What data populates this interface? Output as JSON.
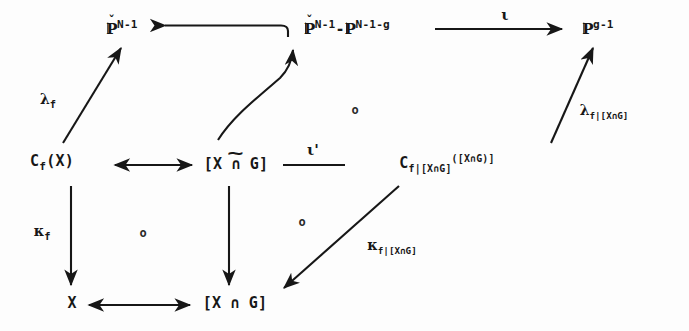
{
  "figure": {
    "kind": "commutative-diagram",
    "width": 689,
    "height": 331,
    "background_color": "#fdfdfd",
    "ink_color": "#171717"
  },
  "nodes": {
    "top_left": {
      "id": "node-p-dual-n-1",
      "plain": "P^(N-1) dual",
      "base": "P",
      "accent": "caron",
      "superscript": "N-1",
      "x": 122,
      "y": 28
    },
    "top_middle": {
      "id": "node-p-dual-minus-p",
      "plain": "P^(N-1) dual - P^(N-1-g)",
      "base": "P",
      "accent": "caron",
      "superscript": "N-1",
      "minus": "-",
      "base2": "P",
      "superscript2": "N-1-g",
      "x": 347,
      "y": 28
    },
    "top_right": {
      "id": "node-p-g-1",
      "plain": "P^(g-1)",
      "base": "P",
      "superscript": "g-1",
      "x": 598,
      "y": 28
    },
    "mid_left": {
      "id": "node-c-f-x",
      "plain": "C_f(X)",
      "head": "C",
      "subscript": "f",
      "tail": "(X)",
      "x": 52,
      "y": 163
    },
    "mid_center": {
      "id": "node-bracket-x-cap-g-tilde",
      "plain": "[X n G]",
      "text": "[X ∩ G]",
      "accent": "tilde",
      "x": 236,
      "y": 165
    },
    "mid_right": {
      "id": "node-c-f-restricted",
      "plain": "C_{f|[X n G]}([X n G])",
      "head": "C",
      "subscript": "f|[X∩G]",
      "tail": "([X∩G)]",
      "x": 447,
      "y": 164
    },
    "bottom_left": {
      "id": "node-x",
      "plain": "X",
      "text": "X",
      "x": 72,
      "y": 304
    },
    "bottom_center": {
      "id": "node-bracket-x-cap-g",
      "plain": "[X n G]",
      "text": "[X ∩ G]",
      "x": 235,
      "y": 304
    }
  },
  "arrow_labels": {
    "lambda_f": {
      "id": "label-lambda-f",
      "plain": "lambda_f",
      "greek": "λ",
      "subscript": "f",
      "x": 48,
      "y": 101
    },
    "lambda_f_restricted": {
      "id": "label-lambda-f-restricted",
      "plain": "lambda_{f|[X n G]}",
      "greek": "λ",
      "subscript": "f|[X∩G]",
      "x": 604,
      "y": 112
    },
    "kappa_f": {
      "id": "label-kappa-f",
      "plain": "kappa_f",
      "greek": "κ",
      "subscript": "f",
      "x": 42,
      "y": 233
    },
    "kappa_f_restricted": {
      "id": "label-kappa-f-restricted",
      "plain": "kappa_{f|[X n G]}",
      "greek": "κ",
      "subscript": "f|[X∩G]",
      "x": 392,
      "y": 247
    },
    "iota": {
      "id": "label-iota",
      "plain": "iota",
      "greek": "ι",
      "x": 505,
      "y": 18
    },
    "iota_prime": {
      "id": "label-iota-prime",
      "plain": "iota prime",
      "greek": "ι'",
      "x": 313,
      "y": 152
    }
  },
  "commute_marks": [
    {
      "id": "commute-mark-upper-right",
      "glyph": "o",
      "x": 355,
      "y": 110
    },
    {
      "id": "commute-mark-lower-left",
      "glyph": "o",
      "x": 143,
      "y": 233
    },
    {
      "id": "commute-mark-lower-right",
      "glyph": "o",
      "x": 302,
      "y": 222
    }
  ],
  "edges": [
    {
      "id": "edge-top-middle-to-top-left",
      "from": "top_middle",
      "to": "top_left",
      "style": "hooked-left-arrow",
      "label": ""
    },
    {
      "id": "edge-top-middle-to-top-right",
      "from": "top_middle",
      "to": "top_right",
      "style": "right-arrow",
      "label": "iota"
    },
    {
      "id": "edge-mid-left-to-mid-center",
      "from": "mid_left",
      "to": "mid_center",
      "style": "double-headed-arrow",
      "label": ""
    },
    {
      "id": "edge-mid-center-to-mid-right",
      "from": "mid_center",
      "to": "mid_right",
      "style": "plain-line",
      "label": "iota_prime"
    },
    {
      "id": "edge-mid-left-to-top-left",
      "from": "mid_left",
      "to": "top_left",
      "style": "diagonal-up-arrow",
      "label": "lambda_f"
    },
    {
      "id": "edge-mid-center-to-top-middle",
      "from": "mid_center",
      "to": "top_middle",
      "style": "curved-diagonal-up-arrow",
      "label": ""
    },
    {
      "id": "edge-mid-right-to-top-right",
      "from": "mid_right",
      "to": "top_right",
      "style": "diagonal-up-arrow",
      "label": "lambda_f_restricted"
    },
    {
      "id": "edge-mid-left-to-bottom-left",
      "from": "mid_left",
      "to": "bottom_left",
      "style": "vertical-down-arrow",
      "label": "kappa_f"
    },
    {
      "id": "edge-mid-center-to-bottom-center",
      "from": "mid_center",
      "to": "bottom_center",
      "style": "vertical-down-arrow",
      "label": ""
    },
    {
      "id": "edge-mid-right-to-bottom-center",
      "from": "mid_right",
      "to": "bottom_center",
      "style": "diagonal-down-arrow",
      "label": "kappa_f_restricted"
    },
    {
      "id": "edge-bottom-left-to-bottom-center",
      "from": "bottom_left",
      "to": "bottom_center",
      "style": "double-headed-arrow",
      "label": ""
    }
  ]
}
